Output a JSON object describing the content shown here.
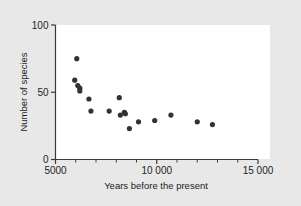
{
  "figure": {
    "background_color": "#e8e8e8",
    "plot_background_color": "#ffffff",
    "axis_color": "#3a3a3a",
    "marker_color": "#333333"
  },
  "axes": {
    "y_title": "Number of species",
    "x_title": "Years before the present",
    "y_ticks": [
      "0",
      "50",
      "100"
    ],
    "x_ticks": [
      "5000",
      "10 000",
      "15 000"
    ]
  },
  "chart_data": {
    "type": "scatter",
    "title": "",
    "xlabel": "Years before the present",
    "ylabel": "Number of species",
    "xlim": [
      5000,
      15000
    ],
    "ylim": [
      0,
      100
    ],
    "xticks": [
      5000,
      10000,
      15000
    ],
    "xtick_labels": [
      "5000",
      "10 000",
      "15 000"
    ],
    "yticks": [
      0,
      50,
      100
    ],
    "ytick_labels": [
      "0",
      "50",
      "100"
    ],
    "x_minor_tick_interval": 1000,
    "grid": false,
    "legend": null,
    "marker": "filled-circle",
    "marker_color": "#333333",
    "points": [
      {
        "x": 6050,
        "y": 75
      },
      {
        "x": 5950,
        "y": 59
      },
      {
        "x": 6100,
        "y": 55
      },
      {
        "x": 6200,
        "y": 53
      },
      {
        "x": 6200,
        "y": 51
      },
      {
        "x": 6650,
        "y": 45
      },
      {
        "x": 6750,
        "y": 36
      },
      {
        "x": 7650,
        "y": 36
      },
      {
        "x": 8150,
        "y": 46
      },
      {
        "x": 8200,
        "y": 33
      },
      {
        "x": 8400,
        "y": 35
      },
      {
        "x": 8450,
        "y": 34
      },
      {
        "x": 8650,
        "y": 23
      },
      {
        "x": 9100,
        "y": 28
      },
      {
        "x": 9900,
        "y": 29
      },
      {
        "x": 10700,
        "y": 33
      },
      {
        "x": 12000,
        "y": 28
      },
      {
        "x": 12750,
        "y": 26
      }
    ]
  }
}
